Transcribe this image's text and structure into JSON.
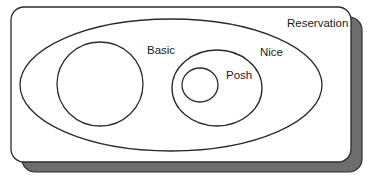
{
  "diagram": {
    "type": "venn-nested-sets",
    "container": {
      "label": "Reservation",
      "box": {
        "x": 11,
        "y": 7,
        "width": 340,
        "height": 155,
        "radius": 13
      },
      "shadow_offset": {
        "dx": 11,
        "dy": 10
      },
      "shadow_color": "#6e6e6e"
    },
    "sets": [
      {
        "id": "reservation",
        "label": "Reservation",
        "shape": "ellipse",
        "cx": 171,
        "cy": 85,
        "rx": 151,
        "ry": 66,
        "label_pos": {
          "x": 287,
          "y": 27
        }
      },
      {
        "id": "basic",
        "label": "Basic",
        "shape": "ellipse",
        "parent": "reservation",
        "cx": 100,
        "cy": 84,
        "rx": 43,
        "ry": 42,
        "label_pos": {
          "x": 147,
          "y": 54
        }
      },
      {
        "id": "nice",
        "label": "Nice",
        "shape": "ellipse",
        "parent": "reservation",
        "cx": 217,
        "cy": 88,
        "rx": 45,
        "ry": 38,
        "label_pos": {
          "x": 260,
          "y": 56
        }
      },
      {
        "id": "posh",
        "label": "Posh",
        "shape": "ellipse",
        "parent": "nice",
        "cx": 200,
        "cy": 85,
        "rx": 18,
        "ry": 17,
        "label_pos": {
          "x": 226,
          "y": 79
        }
      }
    ],
    "labels": {
      "reservation": "Reservation",
      "basic": "Basic",
      "nice": "Nice",
      "posh": "Posh"
    },
    "colors": {
      "stroke": "#2a2a2a",
      "background": "#ffffff",
      "shadow": "#6e6e6e",
      "text": "#1a1a1a"
    }
  }
}
